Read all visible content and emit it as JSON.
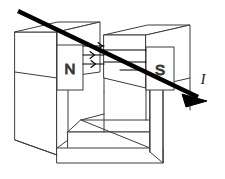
{
  "figure": {
    "type": "physics-line-diagram",
    "background_color": "#ffffff",
    "outline_color": "#3c3c3c",
    "wire_color": "#000000",
    "field_arrow_color": "#000000",
    "label_color": "#111111"
  },
  "labels": {
    "north_pole": "N",
    "south_pole": "S",
    "current": "I"
  },
  "magnet": {
    "shape": "C-shaped yoke",
    "north_pole_face_label": "N",
    "south_pole_face_label": "S"
  },
  "field": {
    "arrow_count": 3,
    "direction": "left-to-right (N to S)"
  },
  "wire": {
    "direction": "upper-left to lower-right",
    "has_arrowhead": true,
    "label": "I"
  }
}
